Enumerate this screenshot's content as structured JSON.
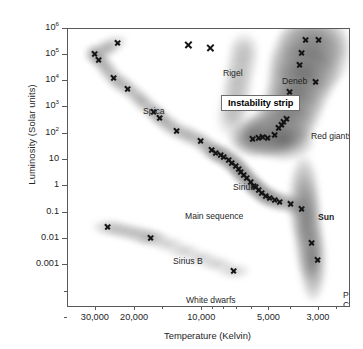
{
  "figure": {
    "background_color": "#ffffff",
    "frame_color": "#5a5a5a",
    "marker_color": "#141414"
  },
  "axes": {
    "x": {
      "label": "Temperature (Kelvin)",
      "scale": "log-reversed",
      "range": [
        40000,
        2200
      ],
      "ticks": [
        {
          "value": 30000,
          "label": "30,000",
          "major": true
        },
        {
          "value": 20000,
          "label": "20,000",
          "major": true
        },
        {
          "value": 15000,
          "label": "",
          "major": false
        },
        {
          "value": 10000,
          "label": "10,000",
          "major": true
        },
        {
          "value": 9000,
          "label": "",
          "major": false
        },
        {
          "value": 8000,
          "label": "",
          "major": false
        },
        {
          "value": 7000,
          "label": "",
          "major": false
        },
        {
          "value": 6000,
          "label": "",
          "major": false
        },
        {
          "value": 5000,
          "label": "5,000",
          "major": true
        },
        {
          "value": 4000,
          "label": "",
          "major": false
        },
        {
          "value": 3000,
          "label": "3,000",
          "major": true
        },
        {
          "value": 2500,
          "label": "",
          "major": false
        }
      ]
    },
    "y": {
      "label": "Luminosity (Solar units)",
      "scale": "log",
      "range": [
        3e-05,
        1000000
      ],
      "ticks": [
        {
          "value": 1000000,
          "label": "10",
          "exp": "6",
          "major": true
        },
        {
          "value": 100000,
          "label": "10",
          "exp": "5",
          "major": true
        },
        {
          "value": 10000,
          "label": "10",
          "exp": "4",
          "major": true
        },
        {
          "value": 1000,
          "label": "10",
          "exp": "3",
          "major": true
        },
        {
          "value": 100,
          "label": "10",
          "exp": "2",
          "major": true
        },
        {
          "value": 10,
          "label": "10",
          "exp": "",
          "major": true
        },
        {
          "value": 1,
          "label": "1",
          "exp": "",
          "major": true
        },
        {
          "value": 0.1,
          "label": "0.1",
          "exp": "",
          "major": true
        },
        {
          "value": 0.01,
          "label": "0.01",
          "exp": "",
          "major": true
        },
        {
          "value": 0.001,
          "label": "0.001",
          "exp": "",
          "major": true
        },
        {
          "value": 0.0001,
          "label": "",
          "exp": "",
          "major": false
        },
        {
          "value": 1e-05,
          "label": "",
          "exp": "",
          "major": false
        }
      ]
    }
  },
  "annotations": [
    {
      "id": "spica",
      "label": "Spica",
      "bold": false,
      "x": 75,
      "y": 78,
      "align": "left"
    },
    {
      "id": "rigel",
      "label": "Rigel",
      "bold": false,
      "x": 155,
      "y": 40,
      "align": "left"
    },
    {
      "id": "deneb",
      "label": "Deneb",
      "bold": false,
      "x": 214,
      "y": 48,
      "align": "left"
    },
    {
      "id": "instability-strip",
      "label": "Instability strip",
      "bold": true,
      "x": 153,
      "y": 66,
      "align": "left"
    },
    {
      "id": "betelgeuse",
      "label": "Betelgeuse",
      "bold": false,
      "x": 300,
      "y": 48,
      "align": "left"
    },
    {
      "id": "antares",
      "label": "Antares",
      "bold": false,
      "x": 302,
      "y": 63,
      "align": "left"
    },
    {
      "id": "red-giants",
      "label": "Red giants",
      "bold": false,
      "x": 243,
      "y": 103,
      "align": "left"
    },
    {
      "id": "aldebaran",
      "label": "Aldebaran",
      "bold": false,
      "x": 297,
      "y": 122,
      "align": "left"
    },
    {
      "id": "sirius",
      "label": "Sirius",
      "bold": false,
      "x": 165,
      "y": 154,
      "align": "left"
    },
    {
      "id": "main-sequence",
      "label": "Main sequence",
      "bold": false,
      "x": 117,
      "y": 183,
      "align": "left"
    },
    {
      "id": "sun",
      "label": "Sun",
      "bold": true,
      "x": 250,
      "y": 184,
      "align": "left"
    },
    {
      "id": "sirius-b",
      "label": "Sirius B",
      "bold": false,
      "x": 105,
      "y": 228,
      "align": "left"
    },
    {
      "id": "barnards-star",
      "label": "Barnard's\nStar",
      "bold": false,
      "x": 306,
      "y": 232,
      "align": "left"
    },
    {
      "id": "white-dwarfs",
      "label": "White dwarfs",
      "bold": false,
      "x": 118,
      "y": 267,
      "align": "left"
    },
    {
      "id": "proxima-centauri",
      "label": "Proxima\nCentauri",
      "bold": false,
      "x": 275,
      "y": 262,
      "align": "left"
    },
    {
      "id": "procyon-b",
      "label": "Procyon B",
      "bold": false,
      "x": 228,
      "y": 288,
      "align": "left"
    }
  ],
  "chart_data": {
    "type": "scatter",
    "xlabel": "Temperature (Kelvin)",
    "ylabel": "Luminosity (Solar units)",
    "xscale": "log",
    "yscale": "log",
    "x_axis_reversed": true,
    "xlim": [
      40000,
      2200
    ],
    "ylim": [
      3e-05,
      1000000
    ],
    "grid": false,
    "legend": null,
    "groups": [
      {
        "name": "Main sequence",
        "points": [
          {
            "temperature": 24000,
            "luminosity": 300000,
            "label": ""
          },
          {
            "temperature": 30500,
            "luminosity": 110000,
            "label": ""
          },
          {
            "temperature": 29000,
            "luminosity": 70000,
            "label": ""
          },
          {
            "temperature": 25000,
            "luminosity": 14000,
            "label": "Spica"
          },
          {
            "temperature": 21500,
            "luminosity": 5500,
            "label": ""
          },
          {
            "temperature": 16500,
            "luminosity": 700,
            "label": ""
          },
          {
            "temperature": 15500,
            "luminosity": 430,
            "label": ""
          },
          {
            "temperature": 13000,
            "luminosity": 140,
            "label": ""
          },
          {
            "temperature": 10200,
            "luminosity": 55,
            "label": ""
          },
          {
            "temperature": 9100,
            "luminosity": 26,
            "label": "Sirius"
          },
          {
            "temperature": 8700,
            "luminosity": 20,
            "label": ""
          },
          {
            "temperature": 8300,
            "luminosity": 17,
            "label": ""
          },
          {
            "temperature": 8000,
            "luminosity": 14,
            "label": ""
          },
          {
            "temperature": 7600,
            "luminosity": 11,
            "label": ""
          },
          {
            "temperature": 7350,
            "luminosity": 8.5,
            "label": ""
          },
          {
            "temperature": 7100,
            "luminosity": 6.5,
            "label": ""
          },
          {
            "temperature": 6900,
            "luminosity": 5.0,
            "label": ""
          },
          {
            "temperature": 6700,
            "luminosity": 3.8,
            "label": ""
          },
          {
            "temperature": 6500,
            "luminosity": 2.9,
            "label": ""
          },
          {
            "temperature": 6300,
            "luminosity": 2.2,
            "label": ""
          },
          {
            "temperature": 6100,
            "luminosity": 1.6,
            "label": ""
          },
          {
            "temperature": 5900,
            "luminosity": 1.15,
            "label": ""
          },
          {
            "temperature": 5778,
            "luminosity": 1.0,
            "label": "Sun"
          },
          {
            "temperature": 5600,
            "luminosity": 0.75,
            "label": ""
          },
          {
            "temperature": 5400,
            "luminosity": 0.58,
            "label": ""
          },
          {
            "temperature": 5200,
            "luminosity": 0.47,
            "label": ""
          },
          {
            "temperature": 5000,
            "luminosity": 0.4,
            "label": ""
          },
          {
            "temperature": 4750,
            "luminosity": 0.33,
            "label": ""
          },
          {
            "temperature": 4500,
            "luminosity": 0.27,
            "label": ""
          },
          {
            "temperature": 4000,
            "luminosity": 0.23,
            "label": ""
          },
          {
            "temperature": 3600,
            "luminosity": 0.145,
            "label": ""
          }
        ]
      },
      {
        "name": "Supergiants",
        "points": [
          {
            "temperature": 11500,
            "luminosity": 260000,
            "label": "Rigel"
          },
          {
            "temperature": 9200,
            "luminosity": 190000,
            "label": "Deneb"
          }
        ]
      },
      {
        "name": "Red giants and supergiants",
        "points": [
          {
            "temperature": 3450,
            "luminosity": 380000,
            "label": ""
          },
          {
            "temperature": 3000,
            "luminosity": 380000,
            "label": ""
          },
          {
            "temperature": 3600,
            "luminosity": 125000,
            "label": "Betelgeuse"
          },
          {
            "temperature": 3650,
            "luminosity": 44000,
            "label": "Antares"
          },
          {
            "temperature": 3100,
            "luminosity": 9500,
            "label": ""
          },
          {
            "temperature": 4050,
            "luminosity": 4000,
            "label": ""
          },
          {
            "temperature": 4200,
            "luminosity": 400,
            "label": "Aldebaran"
          },
          {
            "temperature": 4300,
            "luminosity": 310,
            "label": ""
          },
          {
            "temperature": 4400,
            "luminosity": 230,
            "label": ""
          },
          {
            "temperature": 4550,
            "luminosity": 170,
            "label": ""
          },
          {
            "temperature": 4750,
            "luminosity": 95,
            "label": ""
          },
          {
            "temperature": 5100,
            "luminosity": 75,
            "label": ""
          },
          {
            "temperature": 5350,
            "luminosity": 80,
            "label": ""
          },
          {
            "temperature": 5600,
            "luminosity": 72,
            "label": ""
          },
          {
            "temperature": 5950,
            "luminosity": 68,
            "label": ""
          }
        ]
      },
      {
        "name": "White dwarfs",
        "points": [
          {
            "temperature": 26500,
            "luminosity": 0.03,
            "label": "Sirius B"
          },
          {
            "temperature": 17000,
            "luminosity": 0.012,
            "label": ""
          },
          {
            "temperature": 7200,
            "luminosity": 0.00065,
            "label": "Procyon B"
          }
        ]
      },
      {
        "name": "Red dwarfs",
        "points": [
          {
            "temperature": 3250,
            "luminosity": 0.0075,
            "label": "Barnard's Star"
          },
          {
            "temperature": 3050,
            "luminosity": 0.0017,
            "label": "Proxima Centauri"
          }
        ]
      }
    ]
  }
}
